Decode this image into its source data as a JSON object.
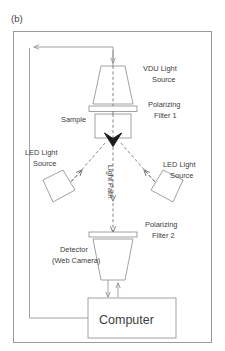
{
  "figure": {
    "panel_label": "(b)",
    "type": "optical-bench-schematic",
    "title_text": ""
  },
  "components": [
    {
      "id": "vdu-light-source",
      "label": "VDU Light\nSource",
      "label_line1": "VDU Light",
      "label_line2": "Source",
      "shape": "trapezoid",
      "shape_note": "narrow-top wide-bottom"
    },
    {
      "id": "polarizing-filter-1",
      "label_line1": "Polarizing",
      "label_line2": "Filter 1",
      "shape": "thin-bar"
    },
    {
      "id": "sample",
      "label_line1": "Sample",
      "label_line2": "",
      "shape": "rectangle"
    },
    {
      "id": "led-light-source-left",
      "label_line1": "LED Light",
      "label_line2": "Source",
      "shape": "rotated-trapezoid"
    },
    {
      "id": "led-light-source-right",
      "label_line1": "LED Light",
      "label_line2": "Source",
      "shape": "rotated-trapezoid"
    },
    {
      "id": "light-path",
      "label_line1": "Light Path",
      "label_line2": "",
      "shape": "dashed-arrow"
    },
    {
      "id": "polarizing-filter-2",
      "label_line1": "Polarizing",
      "label_line2": "Filter 2",
      "shape": "thin-bar"
    },
    {
      "id": "detector-web-camera",
      "label_line1": "Detector",
      "label_line2": "(Web Camera)",
      "shape": "inverted-trapezoid"
    },
    {
      "id": "computer",
      "label_line1": "Computer",
      "label_line2": "",
      "shape": "rectangle"
    }
  ],
  "colors": {
    "outline": "#8a8a8a",
    "frame": "#9a9a9a",
    "beam": "#6d6d6d",
    "text": "#3d3d3d",
    "arrowhead_fill": "#1a1a1a",
    "background": "#ffffff"
  }
}
